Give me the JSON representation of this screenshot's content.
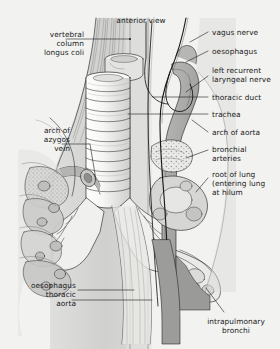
{
  "figure": {
    "title": "anterior view",
    "background_color": "#f2f2f0",
    "ink_color": "#1b1b1b",
    "style": "grayscale line drawing with halftone shading"
  },
  "labels": {
    "left": [
      {
        "id": "vertebral-column-longus-coli",
        "text": "vertebral\ncolumn\nlongus coli",
        "x": 14,
        "y": 30,
        "align": "right",
        "width": 70
      },
      {
        "id": "arch-of-azygos-vein",
        "text": "arch of\nazygos\nvein",
        "x": 8,
        "y": 126,
        "align": "right",
        "width": 66
      },
      {
        "id": "oesophagus-thoracic-aorta",
        "text": "oesophagus\nthoracic\naorta",
        "x": 4,
        "y": 281,
        "align": "right",
        "width": 72
      }
    ],
    "right": [
      {
        "id": "vagus-nerve",
        "text": "vagus nerve",
        "x": 212,
        "y": 28,
        "align": "left",
        "width": 68
      },
      {
        "id": "oesophagus",
        "text": "oesophagus",
        "x": 212,
        "y": 47,
        "align": "left",
        "width": 68
      },
      {
        "id": "left-recurrent-laryngeal-nerve",
        "text": "left recurrent\nlaryngeal nerve",
        "x": 212,
        "y": 66,
        "align": "left",
        "width": 68
      },
      {
        "id": "thoracic-duct",
        "text": "thoracic duct",
        "x": 212,
        "y": 93,
        "align": "left",
        "width": 68
      },
      {
        "id": "trachea",
        "text": "trachea",
        "x": 212,
        "y": 110,
        "align": "left",
        "width": 68
      },
      {
        "id": "arch-of-aorta",
        "text": "arch of aorta",
        "x": 212,
        "y": 128,
        "align": "left",
        "width": 68
      },
      {
        "id": "bronchial-arteries",
        "text": "bronchial\narteries",
        "x": 212,
        "y": 145,
        "align": "left",
        "width": 68
      },
      {
        "id": "root-of-lung",
        "text": "root of lung\n(entering lung\nat hilum",
        "x": 212,
        "y": 170,
        "align": "left",
        "width": 70
      }
    ],
    "bottom": [
      {
        "id": "intrapulmonary-bronchi",
        "text": "intrapulmonary\nbronchi",
        "x": 196,
        "y": 317,
        "align": "center",
        "width": 84
      }
    ]
  },
  "palette": {
    "paper": "#f2f2f0",
    "line": "#1b1b1b",
    "muscle_gray": "#b9b9b7",
    "vessel_gray": "#9e9e9c",
    "vessel_dark": "#7d7d7b",
    "lung_light": "#dedede",
    "node_gray": "#c9c9c7",
    "aorta_gray": "#a5a5a3",
    "shadow": "#8a8a88"
  }
}
